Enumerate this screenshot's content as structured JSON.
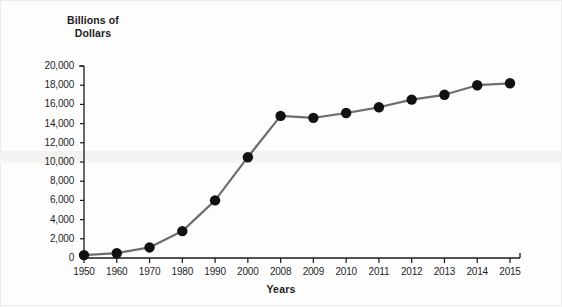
{
  "chart_data": {
    "type": "line",
    "title": "",
    "ylabel": "Billions of\nDollars",
    "ylabel_line1": "Billions of",
    "ylabel_line2": "Dollars",
    "xlabel": "Years",
    "categories": [
      "1950",
      "1960",
      "1970",
      "1980",
      "1990",
      "2000",
      "2008",
      "2009",
      "2010",
      "2011",
      "2012",
      "2013",
      "2014",
      "2015"
    ],
    "values": [
      300,
      500,
      1100,
      2800,
      6000,
      10500,
      14800,
      14600,
      15100,
      15700,
      16500,
      17000,
      18000,
      18200
    ],
    "series": [
      {
        "name": "Billions of Dollars",
        "values": [
          300,
          500,
          1100,
          2800,
          6000,
          10500,
          14800,
          14600,
          15100,
          15700,
          16500,
          17000,
          18000,
          18200
        ]
      }
    ],
    "ylim": [
      0,
      20000
    ],
    "ytick_labels": [
      "20,000",
      "18,000",
      "16,000",
      "14,000",
      "12,000",
      "10,000",
      "8,000",
      "6,000",
      "4,000",
      "2,000",
      "0"
    ],
    "ytick_values": [
      20000,
      18000,
      16000,
      14000,
      12000,
      10000,
      8000,
      6000,
      4000,
      2000,
      0
    ],
    "ytick_step": 2000,
    "grid": false,
    "legend": "none",
    "marker": "filled-circle",
    "marker_color": "#111111",
    "line_color": "#6e6e6e",
    "axis_color": "#1a1a1a",
    "background_color": "#fdfdfd"
  }
}
